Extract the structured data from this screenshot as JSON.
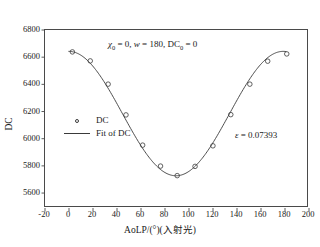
{
  "chart_data": {
    "type": "scatter",
    "title": "",
    "xlabel": "AoLP/(°)(入射光)",
    "ylabel": "DC",
    "xlim": [
      -20,
      200
    ],
    "ylim": [
      5490,
      6800
    ],
    "xticks": [
      -20,
      0,
      20,
      40,
      60,
      80,
      100,
      120,
      140,
      160,
      180,
      200
    ],
    "yticks": [
      5600,
      5800,
      6000,
      6200,
      6400,
      6600,
      6800
    ],
    "xtick_labels": [
      "-20",
      "0",
      "20",
      "40",
      "60",
      "80",
      "100",
      "120",
      "140",
      "160",
      "180",
      "200"
    ],
    "ytick_labels": [
      "5600",
      "5800",
      "6000",
      "6200",
      "6400",
      "6600",
      "6800"
    ],
    "grid": false,
    "legend_position": "inside-left-center",
    "series": [
      {
        "name": "DC",
        "type": "scatter",
        "marker": "open-circle",
        "color": "#3a3a3a",
        "x": [
          3,
          18,
          33,
          48,
          62,
          77,
          91,
          106,
          121,
          136,
          152,
          167,
          183
        ],
        "y": [
          6637,
          6570,
          6397,
          6168,
          5943,
          5787,
          5716,
          5785,
          5938,
          6170,
          6397,
          6568,
          6622
        ]
      },
      {
        "name": "Fit of DC",
        "type": "line",
        "color": "#3a3a3a",
        "description": "cosine fit DC = DC0 + A*cos(2*pi*(x - x0)/w)",
        "fit_params": {
          "x0": 0,
          "w": 180,
          "DC0": 0,
          "amplitude": 463,
          "offset": 6178
        },
        "x": [
          0,
          180
        ],
        "y": [
          6641,
          6641
        ]
      }
    ],
    "annotations": [
      {
        "name": "parameters",
        "text": "χ0 = 0, w = 180, DC0 = 0",
        "x": 90,
        "y": 6700
      },
      {
        "name": "epsilon",
        "text": "ε = 0.07393",
        "x": 165,
        "y": 5990
      }
    ]
  },
  "axes": {
    "x_title": "AoLP/(°)(入射光)",
    "y_title": "DC",
    "x_tick_labels": [
      "-20",
      "0",
      "20",
      "40",
      "60",
      "80",
      "100",
      "120",
      "140",
      "160",
      "180",
      "200"
    ],
    "y_tick_labels": [
      "5600",
      "5800",
      "6000",
      "6200",
      "6400",
      "6600",
      "6800"
    ]
  },
  "legend": {
    "entries": [
      {
        "label": "DC",
        "key": "open-circle-marker"
      },
      {
        "label": "Fit of DC",
        "key": "solid-line"
      }
    ]
  },
  "annotations": {
    "param_chi_symbol": "χ",
    "param_chi_sub": "0",
    "param_chi_value": " = 0, ",
    "param_w_symbol": "w",
    "param_w_value": " = 180, ",
    "param_dc_symbol": "DC",
    "param_dc_sub": "0",
    "param_dc_value": " = 0",
    "epsilon_symbol": "ε",
    "epsilon_value": " = 0.07393"
  },
  "style": {
    "axis_color": "#4a4a4a",
    "data_color": "#3a3a3a",
    "text_color": "#1a1a1a",
    "background": "#ffffff"
  }
}
